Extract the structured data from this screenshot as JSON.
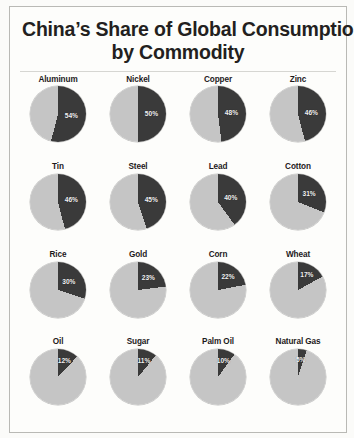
{
  "header": {
    "title_line1": "China’s Share of Global Consumption",
    "title_line2": "by Commodity"
  },
  "colors": {
    "china_share": "#3a3a3a",
    "rest_of_world": "#c5c5c5",
    "title_text": "#231f20",
    "label_text": "#1d1a1b",
    "value_text": "#f2f2f2",
    "background": "#fbfbf9",
    "frame_border": "#b9b9b5"
  },
  "chart_data": {
    "type": "pie",
    "title": "China’s Share of Global Consumption by Commodity",
    "subtitle": "",
    "xlabel": "",
    "ylabel": "",
    "units": "percent",
    "legend": [
      {
        "name": "China",
        "color": "#3a3a3a"
      },
      {
        "name": "Rest of World",
        "color": "#c5c5c5"
      }
    ],
    "legend_position": "none",
    "grid": false,
    "start_angle_deg": 0,
    "direction": "clockwise",
    "rows": 4,
    "columns": 4,
    "categories": [
      "Aluminum",
      "Nickel",
      "Copper",
      "Zinc",
      "Tin",
      "Steel",
      "Lead",
      "Cotton",
      "Rice",
      "Gold",
      "Corn",
      "Wheat",
      "Oil",
      "Sugar",
      "Palm Oil",
      "Natural Gas"
    ],
    "values": [
      54,
      50,
      48,
      46,
      46,
      45,
      40,
      31,
      30,
      23,
      22,
      17,
      12,
      11,
      10,
      5
    ],
    "pies": [
      {
        "label": "Aluminum",
        "value": 54,
        "value_label": "54%",
        "remainder": 46
      },
      {
        "label": "Nickel",
        "value": 50,
        "value_label": "50%",
        "remainder": 50
      },
      {
        "label": "Copper",
        "value": 48,
        "value_label": "48%",
        "remainder": 52
      },
      {
        "label": "Zinc",
        "value": 46,
        "value_label": "46%",
        "remainder": 54
      },
      {
        "label": "Tin",
        "value": 46,
        "value_label": "46%",
        "remainder": 54
      },
      {
        "label": "Steel",
        "value": 45,
        "value_label": "45%",
        "remainder": 55
      },
      {
        "label": "Lead",
        "value": 40,
        "value_label": "40%",
        "remainder": 60
      },
      {
        "label": "Cotton",
        "value": 31,
        "value_label": "31%",
        "remainder": 69
      },
      {
        "label": "Rice",
        "value": 30,
        "value_label": "30%",
        "remainder": 70
      },
      {
        "label": "Gold",
        "value": 23,
        "value_label": "23%",
        "remainder": 77
      },
      {
        "label": "Corn",
        "value": 22,
        "value_label": "22%",
        "remainder": 78
      },
      {
        "label": "Wheat",
        "value": 17,
        "value_label": "17%",
        "remainder": 83
      },
      {
        "label": "Oil",
        "value": 12,
        "value_label": "12%",
        "remainder": 88
      },
      {
        "label": "Sugar",
        "value": 11,
        "value_label": "11%",
        "remainder": 89
      },
      {
        "label": "Palm Oil",
        "value": 10,
        "value_label": "10%",
        "remainder": 90
      },
      {
        "label": "Natural Gas",
        "value": 5,
        "value_label": "5%",
        "remainder": 95
      }
    ]
  }
}
